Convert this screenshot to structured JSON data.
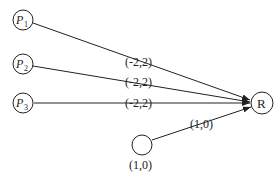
{
  "nodes": [
    {
      "id": "P1",
      "label": "P",
      "sub": "1"
    },
    {
      "id": "P2",
      "label": "P",
      "sub": "2"
    },
    {
      "id": "P3",
      "label": "P",
      "sub": "3"
    },
    {
      "id": "R",
      "label": "R"
    },
    {
      "id": "B",
      "label": "",
      "caption": "(1,0)"
    }
  ],
  "edges": [
    {
      "from": "P1",
      "to": "R",
      "label": "(-2,2)"
    },
    {
      "from": "P2",
      "to": "R",
      "label": "(-2,2)"
    },
    {
      "from": "P3",
      "to": "R",
      "label": "(-2,2)"
    },
    {
      "from": "B",
      "to": "R",
      "label": "(1,0)"
    }
  ]
}
